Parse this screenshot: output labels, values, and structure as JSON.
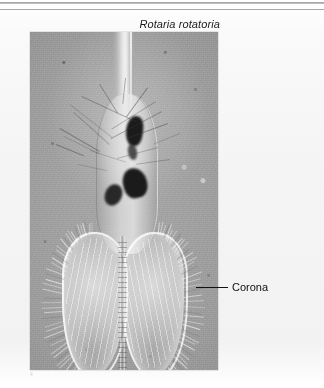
{
  "figure": {
    "species_title": "Rotaria rotatoria",
    "scale_bar_label": "0.1 mm",
    "corner_mark": "4"
  },
  "annotations": {
    "corona_label": "Corona"
  },
  "colors": {
    "page_background": "#f4f4f4",
    "micrograph_base": "#9c9c9c",
    "organ_dark": "#1b1b1b",
    "scalebar": "#080808",
    "bracket": "#f2f2f2",
    "leader": "#111111",
    "text": "#0f0f0f"
  },
  "micrograph": {
    "caption_style": "italic",
    "subject": "rotifer-photomicrograph",
    "features": [
      "foot-stalk",
      "trunk-body",
      "mastax-and-gastric-organs",
      "corona-ciliary-lobes",
      "radiating-cilia"
    ]
  }
}
